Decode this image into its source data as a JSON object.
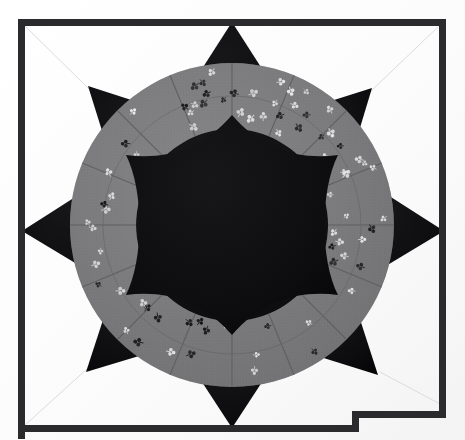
{
  "image": {
    "subject": "Eight-pointed star quilt block photograph",
    "width": 465,
    "height": 440,
    "background_label": "white quilt background fabric"
  },
  "colors": {
    "background_white": "#fdfdfd",
    "frame_black": "#2b2b2d",
    "star_black": "#0d0d0f",
    "center_black": "#0a0a0c",
    "ring_gray": "#7b7b7d",
    "ring_gray_dark": "#6c6c6e",
    "ring_gray_light": "#878789",
    "seam_line": "#5a5a5c",
    "quilt_stitch": "#d8d8d8",
    "motif_light": "#e8e8e8",
    "motif_dark": "#1c1c1e"
  },
  "frame": {
    "label": "dark quilt binding border",
    "thickness_px": 7,
    "left_x": 18,
    "top_y": 19,
    "right_x": 446,
    "bottom_y": 432,
    "step_x": 352,
    "step_y": 411,
    "notch_label": "stepped corner where binding continues past photo edge"
  },
  "star": {
    "label": "eight-pointed star",
    "center_x": 232,
    "center_y": 225,
    "point_count": 8,
    "outer_radius_px": 212,
    "point_fill": "star_black",
    "points": [
      {
        "name": "point-top",
        "angle_deg": 270,
        "tip_x": 232,
        "tip_y": 22
      },
      {
        "name": "point-top-right",
        "angle_deg": 315,
        "tip_x": 372,
        "tip_y": 88
      },
      {
        "name": "point-right",
        "angle_deg": 0,
        "tip_x": 444,
        "tip_y": 231
      },
      {
        "name": "point-bottom-right",
        "angle_deg": 45,
        "tip_x": 378,
        "tip_y": 375
      },
      {
        "name": "point-bottom",
        "angle_deg": 90,
        "tip_x": 232,
        "tip_y": 428
      },
      {
        "name": "point-bottom-left",
        "angle_deg": 135,
        "tip_x": 86,
        "tip_y": 372
      },
      {
        "name": "point-left",
        "angle_deg": 180,
        "tip_x": 22,
        "tip_y": 231
      },
      {
        "name": "point-top-left",
        "angle_deg": 225,
        "tip_x": 88,
        "tip_y": 86
      }
    ]
  },
  "ring": {
    "label": "gray floral print pieced ring",
    "center_x": 232,
    "center_y": 225,
    "outer_radius_px": 162,
    "inner_radius_px": 96,
    "wedge_count": 16,
    "fabric": "small-scale light and dark floral sprig print on medium gray ground",
    "seam_label": "radial patchwork seam"
  },
  "center_medallion": {
    "label": "black six-pointed concave center medallion",
    "center_x": 232,
    "center_y": 225,
    "point_radius_px": 110,
    "valley_radius_px": 72,
    "point_count": 6,
    "concave": true
  },
  "quilting": {
    "label": "hand quilting stitch lines",
    "corner_diagonals": [
      {
        "name": "stitch-corner-top-left",
        "x1": 24,
        "y1": 25,
        "x2": 90,
        "y2": 90
      },
      {
        "name": "stitch-corner-top-right",
        "x1": 440,
        "y1": 25,
        "x2": 372,
        "y2": 90
      },
      {
        "name": "stitch-corner-bottom-left",
        "x1": 24,
        "y1": 426,
        "x2": 88,
        "y2": 370
      },
      {
        "name": "stitch-corner-bottom-right",
        "x1": 440,
        "y1": 405,
        "x2": 378,
        "y2": 374
      }
    ]
  },
  "motifs": {
    "label": "printed floral sprigs on ring fabric",
    "count": 78,
    "style": "three-lobed clover sprig"
  },
  "caption": {
    "alt_text": "Photograph of an eight-pointed patchwork star quilt block: black star points on white ground, a medium-gray floral-print ring, and a black concave six-point center medallion, bound with a dark binding."
  }
}
